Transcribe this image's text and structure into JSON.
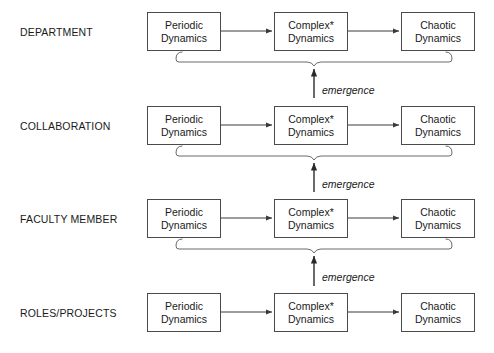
{
  "diagram": {
    "background_color": "#ffffff",
    "line_color": "#4a4a4a",
    "text_color": "#1a1a1a",
    "levels": [
      {
        "label": "DEPARTMENT",
        "nodes": [
          {
            "line1": "Periodic",
            "line2": "Dynamics"
          },
          {
            "line1": "Complex*",
            "line2": "Dynamics"
          },
          {
            "line1": "Chaotic",
            "line2": "Dynamics"
          }
        ]
      },
      {
        "label": "COLLABORATION",
        "nodes": [
          {
            "line1": "Periodic",
            "line2": "Dynamics"
          },
          {
            "line1": "Complex*",
            "line2": "Dynamics"
          },
          {
            "line1": "Chaotic",
            "line2": "Dynamics"
          }
        ]
      },
      {
        "label": "FACULTY MEMBER",
        "nodes": [
          {
            "line1": "Periodic",
            "line2": "Dynamics"
          },
          {
            "line1": "Complex*",
            "line2": "Dynamics"
          },
          {
            "line1": "Chaotic",
            "line2": "Dynamics"
          }
        ]
      },
      {
        "label": "ROLES/PROJECTS",
        "nodes": [
          {
            "line1": "Periodic",
            "line2": "Dynamics"
          },
          {
            "line1": "Complex*",
            "line2": "Dynamics"
          },
          {
            "line1": "Chaotic",
            "line2": "Dynamics"
          }
        ]
      }
    ],
    "emergence_labels": [
      {
        "text": "emergence"
      },
      {
        "text": "emergence"
      },
      {
        "text": "emergence"
      }
    ]
  }
}
